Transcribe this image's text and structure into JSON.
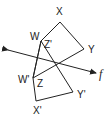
{
  "diagram": {
    "type": "reflection-across-line",
    "line": {
      "name": "f",
      "from": [
        8,
        50
      ],
      "to": [
        96,
        73
      ]
    },
    "original": {
      "name": "WXYZ",
      "vertices": [
        {
          "label": "W",
          "pt": [
            41,
            41
          ],
          "label_pos": [
            31,
            39
          ]
        },
        {
          "label": "X",
          "pt": [
            60,
            22
          ],
          "label_pos": [
            56,
            15
          ]
        },
        {
          "label": "Y",
          "pt": [
            84,
            49
          ],
          "label_pos": [
            88,
            52
          ]
        },
        {
          "label": "Z",
          "pt": [
            33,
            78
          ],
          "label_pos": [
            37,
            86
          ]
        }
      ]
    },
    "image": {
      "name": "W'X'Y'Z'",
      "vertices": [
        {
          "label": "W'",
          "pt": [
            33,
            78
          ],
          "label_pos": [
            19,
            82
          ]
        },
        {
          "label": "X'",
          "pt": [
            36,
            101
          ],
          "label_pos": [
            33,
            113
          ]
        },
        {
          "label": "Y'",
          "pt": [
            73,
            92
          ],
          "label_pos": [
            77,
            97
          ]
        },
        {
          "label": "Z'",
          "pt": [
            41,
            41
          ],
          "label_pos": [
            44,
            47
          ]
        }
      ]
    },
    "labels": {
      "W": "W",
      "X": "X",
      "Y": "Y",
      "Z": "Z",
      "W_prime": "W'",
      "X_prime": "X'",
      "Y_prime": "Y'",
      "Z_prime": "Z'",
      "line_f": "f"
    },
    "stroke_color": "#222222"
  }
}
